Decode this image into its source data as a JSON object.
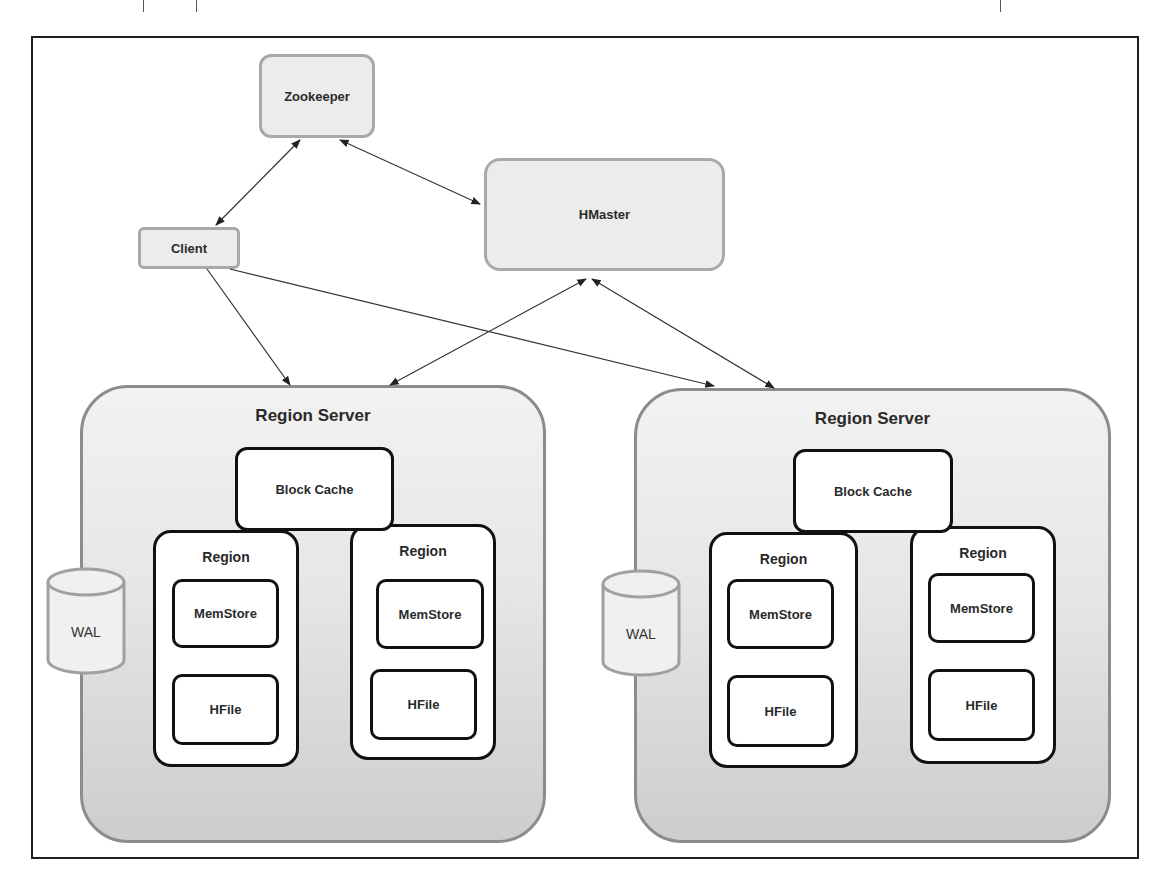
{
  "diagram": {
    "nodes": {
      "zookeeper": "Zookeeper",
      "hmaster": "HMaster",
      "client": "Client"
    },
    "region_servers": [
      {
        "title": "Region Server",
        "block_cache": "Block Cache",
        "wal": "WAL",
        "regions": [
          {
            "title": "Region",
            "memstore": "MemStore",
            "hfile": "HFile"
          },
          {
            "title": "Region",
            "memstore": "MemStore",
            "hfile": "HFile"
          }
        ]
      },
      {
        "title": "Region Server",
        "block_cache": "Block Cache",
        "wal": "WAL",
        "regions": [
          {
            "title": "Region",
            "memstore": "MemStore",
            "hfile": "HFile"
          },
          {
            "title": "Region",
            "memstore": "MemStore",
            "hfile": "HFile"
          }
        ]
      }
    ],
    "edges": [
      {
        "from": "Zookeeper",
        "to": "Client",
        "bidirectional": true
      },
      {
        "from": "Zookeeper",
        "to": "HMaster",
        "bidirectional": true
      },
      {
        "from": "Client",
        "to": "Region Server 1",
        "bidirectional": false
      },
      {
        "from": "Client",
        "to": "Region Server 2",
        "bidirectional": false
      },
      {
        "from": "HMaster",
        "to": "Region Server 1",
        "bidirectional": true
      },
      {
        "from": "HMaster",
        "to": "Region Server 2",
        "bidirectional": true
      }
    ],
    "colors": {
      "light_box_fill": "#ececec",
      "light_box_border": "#a9a9a9",
      "server_border": "#8c8c8c",
      "inner_border": "#111111",
      "frame_border": "#1e1e1e"
    }
  }
}
